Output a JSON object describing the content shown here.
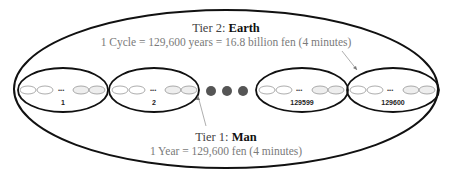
{
  "tier2": {
    "title_prefix": "Tier 2: ",
    "title_bold": "Earth",
    "subtitle": "1 Cycle = 129,600 years = 16.8 billion fen (4 minutes)"
  },
  "tier1": {
    "title_prefix": "Tier 1: ",
    "title_bold": "Man",
    "subtitle": "1 Year = 129,600 fen (4 minutes)"
  },
  "year_groups": [
    {
      "label": "1",
      "inner": [
        "1",
        "2",
        "129599",
        "129600"
      ]
    },
    {
      "label": "2",
      "inner": [
        "1",
        "2",
        "129599",
        "129600"
      ]
    },
    {
      "label": "129599",
      "inner": [
        "1",
        "2",
        "129599",
        "129600"
      ]
    },
    {
      "label": "129600",
      "inner": [
        "1",
        "2",
        "129599",
        "129600"
      ]
    }
  ],
  "ellipsis_small": "•••",
  "colors": {
    "outline": "#111111",
    "arrow": "#999999",
    "dots": "#555555",
    "subtitle": "#7a7a7a"
  }
}
